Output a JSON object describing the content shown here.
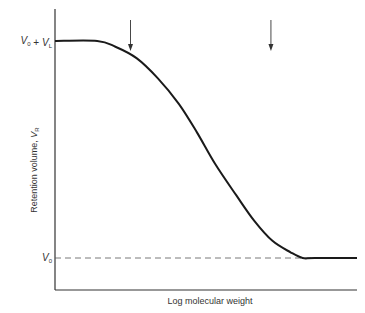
{
  "chart_data": {
    "type": "line",
    "title": "",
    "xlabel": "Log molecular weight",
    "ylabel": "Retention volume, V_R",
    "ylabel_parts": {
      "main": "Retention volume, ",
      "var": "V",
      "sub": "R"
    },
    "xlim": [
      0,
      1
    ],
    "ylim": [
      0,
      1
    ],
    "y_ticks": [
      {
        "value": 0.88,
        "label_parts": [
          {
            "v": "V",
            "s": "0"
          },
          {
            "t": " + "
          },
          {
            "v": "V",
            "s": "L"
          }
        ],
        "label": "V0 + VL"
      },
      {
        "value": 0.12,
        "label_parts": [
          {
            "v": "V",
            "s": "0"
          }
        ],
        "label": "V0"
      }
    ],
    "reference_lines": [
      {
        "name": "V0",
        "value": 0.12,
        "style": "dashed"
      }
    ],
    "annotations": [
      {
        "type": "arrow-down",
        "x": 0.25,
        "note": "exclusion limit"
      },
      {
        "type": "arrow-down",
        "x": 0.715,
        "note": "permeation limit"
      }
    ],
    "series": [
      {
        "name": "calibration curve",
        "x": [
          0.0,
          0.14,
          0.2,
          0.27,
          0.34,
          0.41,
          0.47,
          0.53,
          0.6,
          0.66,
          0.72,
          0.78,
          0.82,
          0.86,
          1.0
        ],
        "y": [
          0.88,
          0.88,
          0.86,
          0.82,
          0.75,
          0.66,
          0.56,
          0.45,
          0.34,
          0.25,
          0.18,
          0.14,
          0.12,
          0.12,
          0.12
        ]
      }
    ],
    "grid": false,
    "legend": "none"
  },
  "colors": {
    "curve": "#1a1a1a",
    "axis": "#333333",
    "dashed": "#555555"
  }
}
